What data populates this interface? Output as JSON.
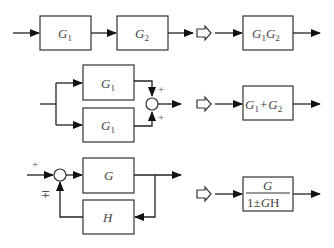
{
  "diagram": {
    "type": "block-diagram-reduction-rules",
    "rows": [
      {
        "name": "series",
        "original": {
          "blocks": [
            {
              "main": "G",
              "sub": "1"
            },
            {
              "main": "G",
              "sub": "2"
            }
          ]
        },
        "equivalent": {
          "parts": [
            {
              "main": "G",
              "sub": "1"
            },
            {
              "main": "G",
              "sub": "2"
            }
          ]
        }
      },
      {
        "name": "parallel",
        "original": {
          "blocks": [
            {
              "main": "G",
              "sub": "1"
            },
            {
              "main": "G",
              "sub": "1"
            }
          ],
          "junction_signs": [
            "+",
            "+"
          ]
        },
        "equivalent": {
          "left": {
            "main": "G",
            "sub": "1"
          },
          "op": "+",
          "right": {
            "main": "G",
            "sub": "2"
          }
        }
      },
      {
        "name": "feedback",
        "original": {
          "forward": "G",
          "feedback": "H",
          "input_sign": "+",
          "feedback_sign": "∓"
        },
        "equivalent": {
          "numerator": "G",
          "denominator_pre": "1±",
          "denominator_g": "G",
          "denominator_h": "H"
        }
      }
    ]
  }
}
